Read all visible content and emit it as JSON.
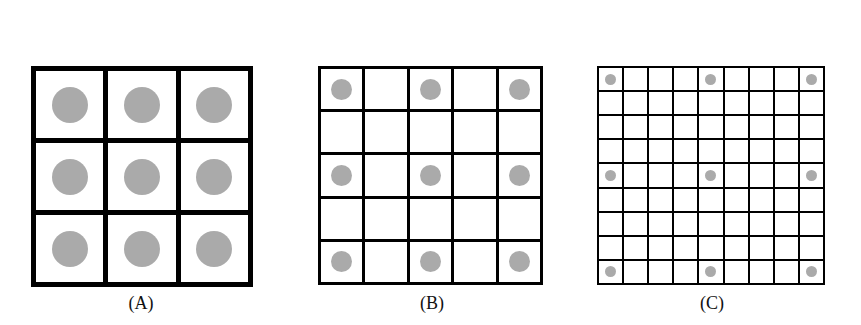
{
  "panels": [
    {
      "label": "(A)",
      "grid_size": 3,
      "dot_positions": "every cell",
      "dot_step": 1,
      "line_width": 5,
      "dot_diameter": 36,
      "box": {
        "x": 31,
        "y": 66,
        "w": 222,
        "h": 221
      },
      "label_center_x": 141
    },
    {
      "label": "(B)",
      "grid_size": 5,
      "dot_positions": "rows/cols 0,2,4",
      "dot_step": 2,
      "line_width": 3,
      "dot_diameter": 21,
      "box": {
        "x": 318,
        "y": 66,
        "w": 225,
        "h": 219
      },
      "label_center_x": 432
    },
    {
      "label": "(C)",
      "grid_size": 9,
      "dot_positions": "rows/cols 0,4,8",
      "dot_step": 4,
      "line_width": 2,
      "dot_diameter": 11,
      "box": {
        "x": 597,
        "y": 66,
        "w": 228,
        "h": 219
      },
      "label_center_x": 712
    }
  ],
  "colors": {
    "line": "#000000",
    "dot": "#aaaaaa",
    "background": "#ffffff"
  }
}
